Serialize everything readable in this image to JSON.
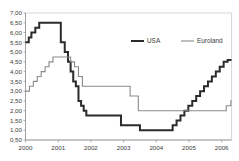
{
  "chart_data": {
    "type": "line",
    "title": "",
    "subtitle": "",
    "xlabel": "",
    "ylabel": "",
    "grid": false,
    "legend_position": "top-right",
    "xlim": [
      2000.0,
      2006.3
    ],
    "ylim": [
      0.5,
      7.0
    ],
    "ytick_labels": [
      "0,50",
      "1,00",
      "1,50",
      "2,00",
      "2,50",
      "3,00",
      "3,50",
      "4,00",
      "4,50",
      "5,00",
      "5,50",
      "6,00",
      "6,50",
      "7,00"
    ],
    "ytick_values": [
      0.5,
      1.0,
      1.5,
      2.0,
      2.5,
      3.0,
      3.5,
      4.0,
      4.5,
      5.0,
      5.5,
      6.0,
      6.5,
      7.0
    ],
    "xtick_labels": [
      "2000",
      "2001",
      "2002",
      "2003",
      "2004",
      "2005",
      "2006"
    ],
    "xtick_values": [
      2000,
      2001,
      2002,
      2003,
      2004,
      2005,
      2006
    ],
    "decimal_separator": ",",
    "series": [
      {
        "name": "USA",
        "color": "#2b2b2b",
        "width": 2.0,
        "step": "post",
        "x": [
          2000.0,
          2000.1,
          2000.18,
          2000.3,
          2000.42,
          2001.08,
          2001.2,
          2001.3,
          2001.38,
          2001.46,
          2001.54,
          2001.62,
          2001.7,
          2001.78,
          2001.86,
          2002.92,
          2003.5,
          2004.5,
          2004.62,
          2004.74,
          2004.86,
          2004.98,
          2005.1,
          2005.22,
          2005.34,
          2005.46,
          2005.58,
          2005.7,
          2005.82,
          2005.94,
          2006.06,
          2006.18,
          2006.28
        ],
        "y": [
          5.5,
          5.75,
          6.0,
          6.25,
          6.5,
          5.5,
          5.0,
          4.5,
          4.0,
          3.5,
          3.25,
          2.5,
          2.25,
          2.0,
          1.75,
          1.25,
          1.0,
          1.25,
          1.5,
          1.75,
          2.0,
          2.25,
          2.5,
          2.75,
          3.0,
          3.25,
          3.5,
          3.75,
          4.0,
          4.25,
          4.5,
          4.6,
          4.6
        ]
      },
      {
        "name": "Euroland",
        "color": "#8a8a8a",
        "width": 1.1,
        "step": "post",
        "x": [
          2000.0,
          2000.12,
          2000.24,
          2000.36,
          2000.48,
          2000.6,
          2000.72,
          2000.84,
          2001.38,
          2001.5,
          2001.62,
          2001.74,
          2002.92,
          2003.2,
          2003.45,
          2005.96,
          2006.14,
          2006.28
        ],
        "y": [
          3.0,
          3.25,
          3.5,
          3.75,
          4.0,
          4.25,
          4.5,
          4.75,
          4.5,
          4.25,
          3.75,
          3.25,
          3.25,
          2.75,
          2.0,
          2.0,
          2.25,
          2.5
        ]
      }
    ],
    "legend": [
      {
        "label": "USA",
        "color": "#2b2b2b",
        "width": 2.0
      },
      {
        "label": "Euroland",
        "color": "#8a8a8a",
        "width": 1.1
      }
    ]
  }
}
